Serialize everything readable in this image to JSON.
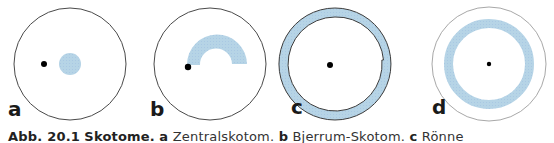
{
  "figure": {
    "panels": [
      {
        "label": "a",
        "name": "Zentralskotom"
      },
      {
        "label": "b",
        "name": "Bjerrum-Skotom"
      },
      {
        "label": "c",
        "name": "Rönne"
      },
      {
        "label": "d",
        "name": ""
      }
    ],
    "colors": {
      "scotoma_fill": "#b4d3e6",
      "outline": "#4a4a4a",
      "fixation_dot": "#000000",
      "light_outline": "#a8a8a8"
    }
  },
  "caption": {
    "figure_number": "Abb. 20.1",
    "title": "Skotome.",
    "part_a_label": "a",
    "part_a_text": "Zentralskotom.",
    "part_b_label": "b",
    "part_b_text": "Bjerrum-Skotom.",
    "part_c_label": "c",
    "part_c_text": "Rönne"
  }
}
